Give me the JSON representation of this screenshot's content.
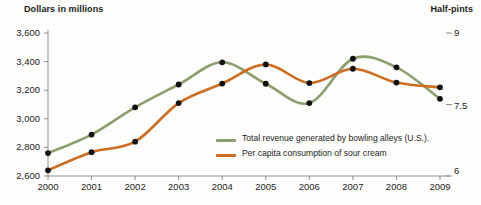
{
  "chart_data": {
    "type": "line",
    "title": "",
    "left_axis_title": "Dollars in millions",
    "right_axis_title": "Half-pints",
    "xlabel": "",
    "x": [
      2000,
      2001,
      2002,
      2003,
      2004,
      2005,
      2006,
      2007,
      2008,
      2009
    ],
    "x_tick_labels": [
      "2000",
      "2001",
      "2002",
      "2003",
      "2004",
      "2005",
      "2006",
      "2007",
      "2008",
      "2009"
    ],
    "left_ylim": [
      2600,
      3600
    ],
    "left_y_tick_labels": [
      "3,600",
      "3,400",
      "3,200",
      "3,000",
      "2,800",
      "2,600"
    ],
    "left_y_ticks": [
      3600,
      3400,
      3200,
      3000,
      2800,
      2600
    ],
    "right_ylim": [
      6,
      9
    ],
    "right_y_tick_labels": [
      "9",
      "7.5",
      "6"
    ],
    "right_y_ticks": [
      9,
      7.5,
      6
    ],
    "grid": false,
    "legend_position": "inside-lower-right",
    "series": [
      {
        "name": "Total revenue generated by bowling alleys (U.S.).",
        "axis": "left",
        "color": "#8c9e6e",
        "marker": "circle",
        "marker_color": "#111111",
        "values": [
          2760,
          2890,
          3080,
          3240,
          3395,
          3245,
          3110,
          3420,
          3360,
          3140
        ]
      },
      {
        "name": "Per capita consumption of sour cream",
        "axis": "right",
        "color": "#cc6d22",
        "marker": "circle",
        "marker_color": "#111111",
        "values": [
          6.12,
          6.5,
          6.72,
          7.53,
          7.94,
          8.34,
          7.95,
          8.25,
          7.96,
          7.86
        ]
      }
    ]
  },
  "colors": {
    "revenue_line": "#8c9e6e",
    "sourcream_line": "#cc6d22",
    "marker": "#111111",
    "axis": "#8f8f8f",
    "text": "#1d1d1d",
    "background": "#fdfdfb"
  }
}
